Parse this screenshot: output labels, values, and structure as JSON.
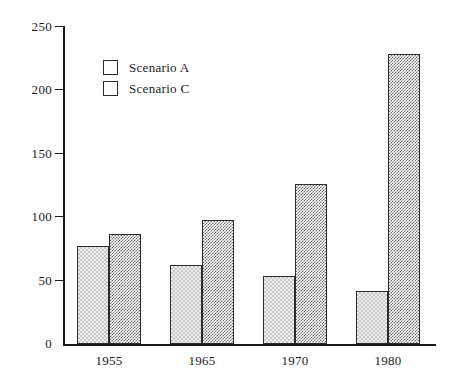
{
  "chart_data": {
    "type": "bar",
    "title": "",
    "subtitle": "",
    "xlabel": "",
    "ylabel": "",
    "categories": [
      "1955",
      "1965",
      "1970",
      "1980"
    ],
    "series": [
      {
        "name": "Scenario A",
        "values": [
          77,
          62,
          54,
          42
        ],
        "fill": "light-checker",
        "color": "#ededed"
      },
      {
        "name": "Scenario C",
        "values": [
          87,
          98,
          126,
          229
        ],
        "fill": "dense-checker",
        "color": "#8a8a8a"
      }
    ],
    "ylim": [
      0,
      250
    ],
    "yticks": [
      0,
      50,
      100,
      150,
      200,
      250
    ],
    "ytick_labels": [
      "0",
      "50",
      "100",
      "150",
      "200",
      "250"
    ],
    "grid": false,
    "legend_position": "upper-left-inside",
    "axes": {
      "left": true,
      "bottom": true,
      "top": false,
      "right": false
    },
    "annotations": []
  },
  "legend": {
    "entries": [
      {
        "label": "Scenario A"
      },
      {
        "label": "Scenario C"
      }
    ]
  }
}
